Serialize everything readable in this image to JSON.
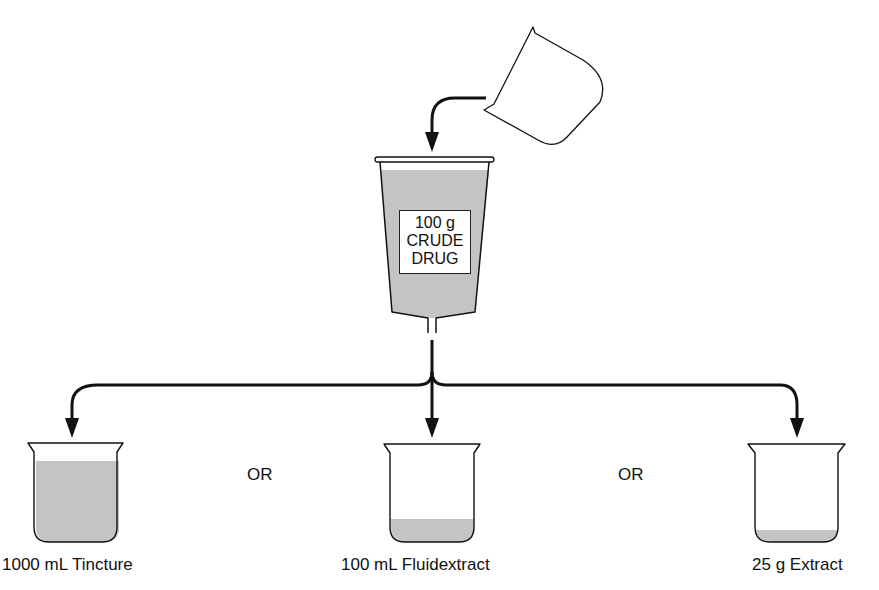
{
  "diagram": {
    "source_label": {
      "line1": "100 g",
      "line2": "CRUDE",
      "line3": "DRUG"
    },
    "products": [
      {
        "label": "1000 mL Tincture",
        "fill_level": "high"
      },
      {
        "label": "100 mL Fluidextract",
        "fill_level": "low"
      },
      {
        "label": "25 g Extract",
        "fill_level": "very-low"
      }
    ],
    "separators": [
      "OR",
      "OR"
    ],
    "colors": {
      "liquid": "#c4c4c4",
      "stroke": "#111111",
      "background": "#ffffff"
    }
  }
}
